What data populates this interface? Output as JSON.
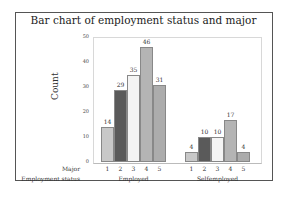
{
  "chart_data": {
    "type": "bar",
    "title": "Bar chart of employment status and major",
    "xlabel": "",
    "ylabel": "Count",
    "ylim": [
      0,
      50
    ],
    "yticks": [
      0,
      10,
      20,
      30,
      40,
      50
    ],
    "grid": false,
    "row_labels": {
      "major": "Major",
      "group": "Employment status"
    },
    "groups": [
      {
        "name": "Employed",
        "categories": [
          "1",
          "2",
          "3",
          "4",
          "5"
        ],
        "values": [
          14,
          29,
          35,
          46,
          31
        ]
      },
      {
        "name": "Selfemployed",
        "categories": [
          "1",
          "2",
          "3",
          "4",
          "5"
        ],
        "values": [
          4,
          10,
          10,
          17,
          4
        ]
      }
    ],
    "colors": [
      "#c8c8c8",
      "#5a5a5a",
      "#f4f4f4",
      "#b4b4b4",
      "#acacac"
    ]
  }
}
